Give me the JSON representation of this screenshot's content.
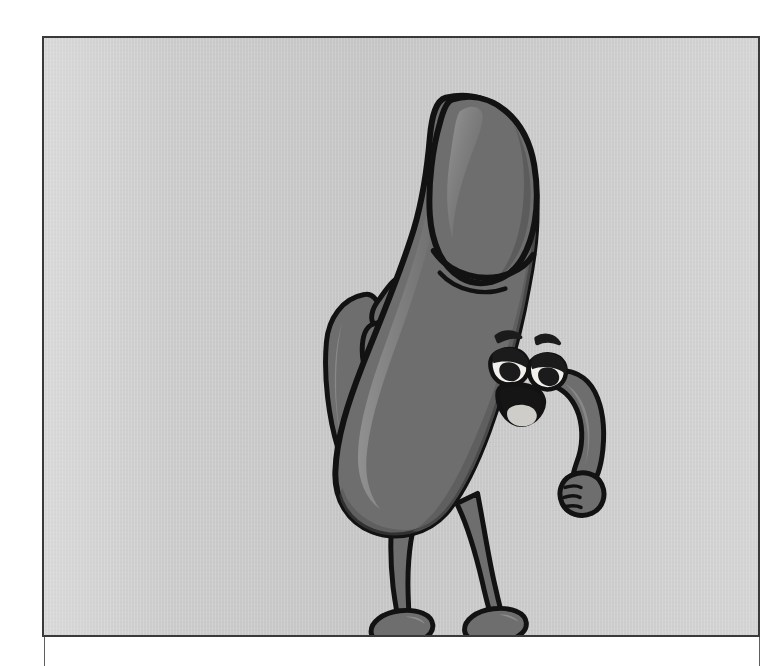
{
  "page": {
    "background_color": "#ffffff",
    "width": 778,
    "height": 666
  },
  "panel": {
    "name": "illustration-panel",
    "frame_color": "#3a3a3a",
    "frame_width_px": 2,
    "left": 42,
    "top": 36,
    "width": 718,
    "height": 601,
    "background_color": "#c8c8c8",
    "background_style": "flat light-gray with soft vertical vignette and faint scan texture",
    "rule_color": "#5e5e5e"
  },
  "illustration": {
    "name": "cartoon-mascot",
    "style": "grayscale cartoon line art with flat cel shading",
    "description": "Smiling elongated cartoon character with a rounded bulbous top, one arm raised waving and the other bent with a fist at the hip, standing on two thin legs with rounded feet.",
    "palette": {
      "outline": "#121212",
      "body_base": "#6e6e6e",
      "body_shadow": "#5a5a5a",
      "body_deep_shadow": "#4e4e4e",
      "body_highlight": "#8a8a8a",
      "body_rim_light": "#9b9b9b",
      "eye_white": "#f2f0ec",
      "eye_lid": "#1b1b1b",
      "tongue": "#cfcdc9"
    },
    "parts": [
      {
        "name": "head-tip",
        "label": "Rounded bulbous top"
      },
      {
        "name": "ridge-line",
        "label": "Ridge crease beneath the tip"
      },
      {
        "name": "body-shaft",
        "label": "Curved elongated body"
      },
      {
        "name": "left-arm",
        "label": "Raised waving arm"
      },
      {
        "name": "left-hand",
        "label": "Open waving hand with fingers"
      },
      {
        "name": "right-arm",
        "label": "Bent arm resting at side"
      },
      {
        "name": "right-fist",
        "label": "Closed fist"
      },
      {
        "name": "left-leg",
        "label": "Left leg"
      },
      {
        "name": "right-leg",
        "label": "Right leg"
      },
      {
        "name": "left-foot",
        "label": "Left rounded foot"
      },
      {
        "name": "right-foot",
        "label": "Right rounded foot"
      },
      {
        "name": "left-eye",
        "label": "Left eye, half-lidded"
      },
      {
        "name": "right-eye",
        "label": "Right eye, half-lidded"
      },
      {
        "name": "left-eyebrow",
        "label": "Left eyebrow"
      },
      {
        "name": "right-eyebrow",
        "label": "Right eyebrow"
      },
      {
        "name": "mouth",
        "label": "Open smiling mouth"
      },
      {
        "name": "tongue",
        "label": "Tongue inside the mouth"
      }
    ]
  }
}
